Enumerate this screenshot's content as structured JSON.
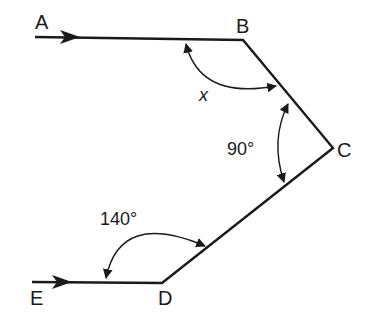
{
  "diagram": {
    "type": "geometry-angles",
    "points": {
      "A": {
        "label": "A"
      },
      "B": {
        "label": "B"
      },
      "C": {
        "label": "C"
      },
      "D": {
        "label": "D"
      },
      "E": {
        "label": "E"
      }
    },
    "angles": {
      "x": {
        "label": "x",
        "at": "B"
      },
      "c": {
        "label": "90°",
        "at": "C"
      },
      "d": {
        "label": "140°",
        "at": "D"
      }
    },
    "colors": {
      "stroke": "#1a1a1a",
      "background": "#ffffff"
    }
  }
}
